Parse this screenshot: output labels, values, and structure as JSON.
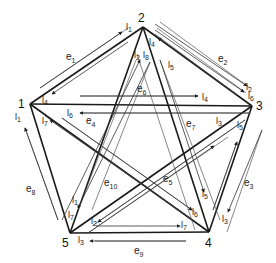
{
  "diagram": {
    "type": "complete-graph-K5",
    "vertices": [
      {
        "id": "1",
        "label": "1",
        "x": 30,
        "y": 104
      },
      {
        "id": "2",
        "label": "2",
        "x": 143,
        "y": 27
      },
      {
        "id": "3",
        "label": "3",
        "x": 252,
        "y": 106
      },
      {
        "id": "4",
        "label": "4",
        "x": 209,
        "y": 232
      },
      {
        "id": "5",
        "label": "5",
        "x": 70,
        "y": 233
      }
    ],
    "edges": [
      {
        "id": "e1",
        "label": "e",
        "sub": "1",
        "from": "1",
        "to": "2",
        "lx": 70,
        "ly": 58
      },
      {
        "id": "e2",
        "label": "e",
        "sub": "2",
        "from": "2",
        "to": "3",
        "lx": 218,
        "ly": 62
      },
      {
        "id": "e3",
        "label": "e",
        "sub": "3",
        "from": "3",
        "to": "4",
        "lx": 244,
        "ly": 186
      },
      {
        "id": "e4",
        "label": "e",
        "sub": "4",
        "from": "1",
        "to": "4",
        "lx": 86,
        "ly": 124
      },
      {
        "id": "e5",
        "label": "e",
        "sub": "5",
        "from": "3",
        "to": "5",
        "lx": 163,
        "ly": 182
      },
      {
        "id": "e6",
        "label": "e",
        "sub": "6",
        "from": "1",
        "to": "3",
        "lx": 137,
        "ly": 94
      },
      {
        "id": "e7",
        "label": "e",
        "sub": "7",
        "from": "2",
        "to": "4",
        "lx": 186,
        "ly": 127
      },
      {
        "id": "e8",
        "label": "e",
        "sub": "8",
        "from": "1",
        "to": "5",
        "lx": 28,
        "ly": 192
      },
      {
        "id": "e9",
        "label": "e",
        "sub": "9",
        "from": "4",
        "to": "5",
        "lx": 136,
        "ly": 257
      },
      {
        "id": "e10",
        "label": "e",
        "sub": "10",
        "from": "2",
        "to": "5",
        "lx": 104,
        "ly": 186
      }
    ],
    "flow_labels": [
      {
        "label": "l",
        "sub": "1",
        "x": 128,
        "y": 28
      },
      {
        "label": "l",
        "sub": "4",
        "x": 43,
        "y": 103
      },
      {
        "label": "l",
        "sub": "2",
        "x": 136,
        "y": 57
      },
      {
        "label": "l",
        "sub": "8",
        "x": 145,
        "y": 57
      },
      {
        "label": "l",
        "sub": "4",
        "x": 150,
        "y": 43
      },
      {
        "label": "l",
        "sub": "5",
        "x": 169,
        "y": 67
      },
      {
        "label": "l",
        "sub": "2",
        "x": 246,
        "y": 88
      },
      {
        "label": "l",
        "sub": "6",
        "x": 248,
        "y": 97
      },
      {
        "label": "l",
        "sub": "4",
        "x": 203,
        "y": 101
      },
      {
        "label": "l",
        "sub": "6",
        "x": 68,
        "y": 116
      },
      {
        "label": "l",
        "sub": "1",
        "x": 16,
        "y": 121
      },
      {
        "label": "l",
        "sub": "7",
        "x": 44,
        "y": 124
      },
      {
        "label": "l",
        "sub": "3",
        "x": 217,
        "y": 124
      },
      {
        "label": "l",
        "sub": "5",
        "x": 237,
        "y": 127
      },
      {
        "label": "l",
        "sub": "1",
        "x": 73,
        "y": 203
      },
      {
        "label": "l",
        "sub": "7",
        "x": 70,
        "y": 218
      },
      {
        "label": "l",
        "sub": "2",
        "x": 92,
        "y": 224
      },
      {
        "label": "l",
        "sub": "7",
        "x": 181,
        "y": 226
      },
      {
        "label": "l",
        "sub": "6",
        "x": 193,
        "y": 215
      },
      {
        "label": "l",
        "sub": "5",
        "x": 203,
        "y": 196
      },
      {
        "label": "l",
        "sub": "3",
        "x": 223,
        "y": 222
      },
      {
        "label": "l",
        "sub": "3",
        "x": 78,
        "y": 241
      }
    ]
  },
  "labels": {
    "v1": "1",
    "v2": "2",
    "v3": "3",
    "v4": "4",
    "v5": "5",
    "e": "e",
    "e1": "1",
    "e2": "2",
    "e3": "3",
    "e4": "4",
    "e5": "5",
    "e6": "6",
    "e7": "7",
    "e8": "8",
    "e9": "9",
    "e10": "10",
    "l": "l"
  }
}
